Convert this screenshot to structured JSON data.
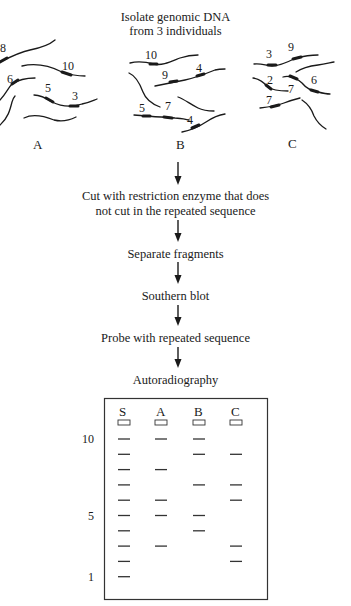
{
  "title": {
    "line1": "Isolate genomic DNA",
    "line2": "from 3 individuals"
  },
  "individuals": [
    {
      "label": "A",
      "fragment_labels": [
        "8",
        "10",
        "6",
        "5",
        "3"
      ]
    },
    {
      "label": "B",
      "fragment_labels": [
        "10",
        "9",
        "4",
        "5",
        "7",
        "4"
      ]
    },
    {
      "label": "C",
      "fragment_labels": [
        "3",
        "9",
        "2",
        "7",
        "6",
        "7"
      ]
    }
  ],
  "steps": [
    {
      "line1": "Cut with restriction enzyme that does",
      "line2": "not cut in the repeated sequence"
    },
    {
      "line1": "Separate fragments"
    },
    {
      "line1": "Southern blot"
    },
    {
      "line1": "Probe with repeated sequence"
    },
    {
      "line1": "Autoradiography"
    }
  ],
  "gel": {
    "lanes": [
      "S",
      "A",
      "B",
      "C"
    ],
    "size_labels": [
      {
        "text": "10",
        "size": 10
      },
      {
        "text": "5",
        "size": 5
      },
      {
        "text": "1",
        "size": 1
      }
    ],
    "bands": {
      "S": [
        10,
        9,
        8,
        7,
        6,
        5,
        4,
        3,
        2,
        1
      ],
      "A": [
        10,
        8,
        6,
        5,
        3
      ],
      "B": [
        10,
        9,
        7,
        5,
        4
      ],
      "C": [
        9,
        7,
        6,
        3,
        2
      ]
    }
  }
}
